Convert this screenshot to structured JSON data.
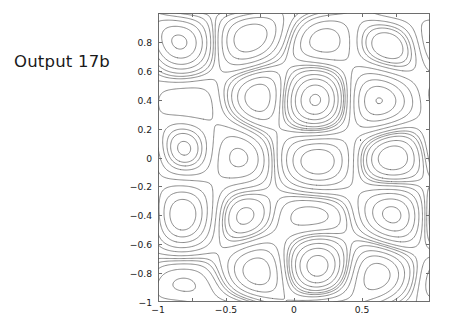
{
  "caption": {
    "text": "Output 17b"
  },
  "chart_data": {
    "type": "contour",
    "title": "",
    "xlabel": "",
    "ylabel": "",
    "xlim": [
      -1,
      1
    ],
    "ylim": [
      -1,
      1
    ],
    "grid": false,
    "legend": null,
    "line_color": "#5a5a5a",
    "frame_color": "#6e6e6e",
    "background": "#ffffff",
    "x_ticks": [
      -1,
      -0.5,
      0,
      0.5
    ],
    "x_tick_labels": [
      "−1",
      "−0.5",
      "0",
      "0.5"
    ],
    "x_minor_ticks": [
      -1,
      -0.75,
      -0.5,
      -0.25,
      0,
      0.25,
      0.5,
      0.75,
      1
    ],
    "y_ticks": [
      -1,
      -0.8,
      -0.6,
      -0.4,
      -0.2,
      0,
      0.2,
      0.4,
      0.6,
      0.8
    ],
    "y_tick_labels": [
      "−1",
      "−0.8",
      "−0.6",
      "−0.4",
      "−0.2",
      "0",
      "0.2",
      "0.4",
      "0.6",
      "0.8"
    ],
    "surface": {
      "description": "oscillatory eigenfunction-like field with tilted/sheared cells",
      "terms": [
        {
          "amp": 1.0,
          "kx": 2.0,
          "ky": 2.5,
          "px": 0.15,
          "py": 0.0,
          "shear": 0.0
        },
        {
          "amp": 0.55,
          "kx": 1.0,
          "ky": 1.0,
          "px": 0.4,
          "py": 0.25,
          "shear": 0.85
        },
        {
          "amp": 0.33,
          "kx": 3.0,
          "ky": 1.0,
          "px": 0.0,
          "py": 0.6,
          "shear": 0.0
        },
        {
          "amp": 0.22,
          "kx": 1.0,
          "ky": 3.0,
          "px": 0.55,
          "py": 0.1,
          "shear": 0.5
        }
      ],
      "tilt": 0.9,
      "ramp_x": 0.35
    },
    "levels": [
      -1.6,
      -1.3,
      -1.0,
      -0.7,
      -0.45,
      -0.22,
      -0.06,
      0.06,
      0.22,
      0.45,
      0.7,
      1.0,
      1.3,
      1.6
    ],
    "n_levels": 14,
    "grid_resolution": 260,
    "marks": [
      {
        "x": 0.49,
        "y": 0.12,
        "kind": "saddle-dot"
      }
    ]
  }
}
